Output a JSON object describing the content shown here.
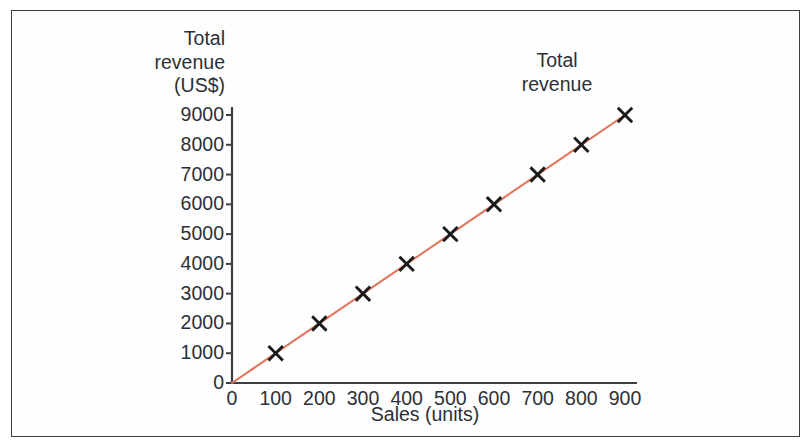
{
  "figure": {
    "frame_color": "#3a3f45",
    "background_color": "#ffffff"
  },
  "chart_data": {
    "type": "line",
    "title": "",
    "subtitle": "",
    "xlabel": "Sales (units)",
    "ylabel": "Total\nrevenue\n(US$)",
    "ylabel_lines": [
      "Total",
      "revenue",
      "(US$)"
    ],
    "annotation": "Total\nrevenue",
    "annotation_lines": [
      "Total",
      "revenue"
    ],
    "grid": false,
    "legend": "none",
    "legend_position": "in-plot-annotation",
    "marker": "x-cross",
    "marker_color": "#1a1a1a",
    "line_color": "#e4765c",
    "axis_color": "#3a3f45",
    "xlim": [
      0,
      900
    ],
    "ylim": [
      0,
      9000
    ],
    "xticks": [
      0,
      100,
      200,
      300,
      400,
      500,
      600,
      700,
      800,
      900
    ],
    "yticks": [
      0,
      1000,
      2000,
      3000,
      4000,
      5000,
      6000,
      7000,
      8000,
      9000
    ],
    "xtick_labels": [
      "0",
      "100",
      "200",
      "300",
      "400",
      "500",
      "600",
      "700",
      "800",
      "900"
    ],
    "ytick_labels": [
      "0",
      "1000",
      "2000",
      "3000",
      "4000",
      "5000",
      "6000",
      "7000",
      "8000",
      "9000"
    ],
    "series": [
      {
        "name": "Total revenue",
        "x": [
          0,
          100,
          200,
          300,
          400,
          500,
          600,
          700,
          800,
          900
        ],
        "values": [
          0,
          1000,
          2000,
          3000,
          4000,
          5000,
          6000,
          7000,
          8000,
          9000
        ],
        "marker_at_origin": false
      }
    ]
  }
}
